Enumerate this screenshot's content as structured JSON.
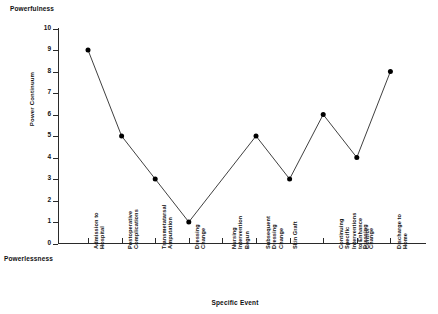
{
  "chart_data": {
    "type": "line",
    "title": "",
    "xlabel": "Specific Event",
    "ylabel": "Power Continuum",
    "ylim": [
      0,
      10
    ],
    "grid": false,
    "legend": "none",
    "marker": "filled-circle",
    "line_color": "#2a2a2a",
    "marker_color": "#000000",
    "y_ticks": [
      0,
      1,
      2,
      3,
      4,
      5,
      6,
      7,
      8,
      9,
      10
    ],
    "y_tick_labels": [
      "0",
      "1",
      "2",
      "3",
      "4",
      "5",
      "6",
      "7",
      "8",
      "9",
      "10"
    ],
    "pole_labels": {
      "high": "Powerfulness",
      "low": "Powerlessness"
    },
    "categories": [
      "Admission to Hospital",
      "Postoperative Complications",
      "Transmetatarsal Amputation",
      "Dressing Change",
      "Nursing Intervention Begun",
      "Subsequent Dressing Change",
      "Skin Graft",
      "Continuing Specific Interventions to Enhance Control",
      "Dressing Change",
      "Discharge to Home"
    ],
    "category_lines": [
      [
        "Admission to",
        "Hospital"
      ],
      [
        "Postoperative",
        "Complications"
      ],
      [
        "Transmetatarsal",
        "Amputation"
      ],
      [
        "Dressing",
        "Change"
      ],
      [
        "Nursing",
        "Intervention",
        "Begun"
      ],
      [
        "Subsequent",
        "Dressing",
        "Change"
      ],
      [
        "Skin Graft"
      ],
      [
        "Continuing",
        "Specific",
        "Interventions",
        "to Enhance",
        "Control"
      ],
      [
        "Dressing",
        "Change"
      ],
      [
        "Discharge to",
        "Home"
      ]
    ],
    "values": [
      9,
      5,
      3,
      1,
      null,
      5,
      3,
      6,
      4,
      8
    ],
    "markers_shown": [
      true,
      true,
      true,
      true,
      false,
      true,
      true,
      true,
      true,
      true
    ]
  }
}
